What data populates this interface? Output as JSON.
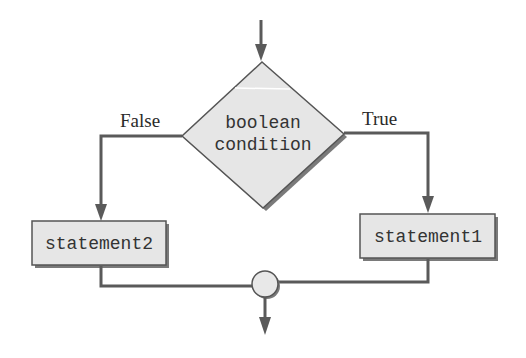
{
  "diagram": {
    "type": "flowchart",
    "decision": {
      "line1": "boolean",
      "line2": "condition",
      "shape": "diamond"
    },
    "branches": {
      "false_label": "False",
      "true_label": "True"
    },
    "statements": {
      "left": "statement2",
      "right": "statement1"
    },
    "junction": {
      "shape": "circle"
    },
    "colors": {
      "fill": "#e6e6e6",
      "stroke": "#555555",
      "shadow": "#7a7a7a",
      "line": "#5a5a5a",
      "text": "#2a2a2a",
      "background": "#ffffff"
    }
  }
}
